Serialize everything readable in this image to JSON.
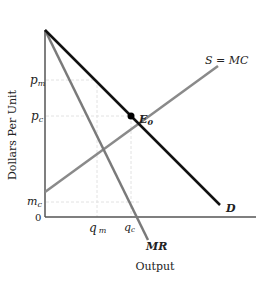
{
  "diagram": {
    "y_axis_label": "Dollars Per Unit",
    "x_axis_label": "Output",
    "origin_label": "0",
    "y_ticks": [
      {
        "label": "p",
        "sub": "m",
        "y": 80
      },
      {
        "label": "p",
        "sub": "c",
        "y": 116
      },
      {
        "label": "m",
        "sub": "c",
        "y": 202
      }
    ],
    "x_ticks": [
      {
        "label": "q",
        "sub": "m",
        "x": 97
      },
      {
        "label": "q",
        "sub": "c",
        "x": 131
      }
    ],
    "curves": {
      "demand": {
        "label": "D",
        "color": "#111111"
      },
      "marginal_revenue": {
        "label": "MR",
        "color": "#7a7a7a"
      },
      "supply": {
        "label": "S = MC",
        "color": "#8a8a8a"
      }
    },
    "equilibrium": {
      "label": "E",
      "sub": "0"
    },
    "colors": {
      "axis": "#555555",
      "guide": "#e4e4e4"
    }
  }
}
